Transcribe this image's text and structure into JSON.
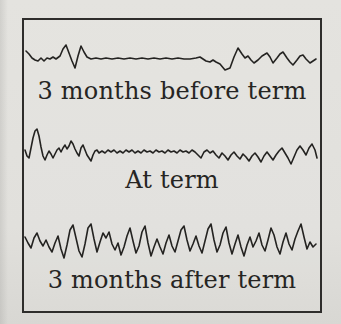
{
  "figure": {
    "background_color": "#e1e0dc",
    "frame_color": "#2e2d2b",
    "trace_color": "#242321",
    "text_color": "#262523",
    "panels": [
      {
        "label": "3 months before term"
      },
      {
        "label": "At term"
      },
      {
        "label": "3 months after term"
      }
    ],
    "traces": [
      {
        "name": "trace-3-months-before-term",
        "points": [
          [
            26,
            51
          ],
          [
            29,
            54
          ],
          [
            32,
            58
          ],
          [
            35,
            60
          ],
          [
            38,
            61
          ],
          [
            41,
            58
          ],
          [
            44,
            61
          ],
          [
            47,
            58
          ],
          [
            50,
            59
          ],
          [
            53,
            57
          ],
          [
            56,
            59
          ],
          [
            60,
            56
          ],
          [
            63,
            49
          ],
          [
            66,
            45
          ],
          [
            69,
            53
          ],
          [
            72,
            61
          ],
          [
            75,
            68
          ],
          [
            78,
            56
          ],
          [
            81,
            46
          ],
          [
            84,
            52
          ],
          [
            87,
            57
          ],
          [
            91,
            59
          ],
          [
            96,
            58
          ],
          [
            101,
            59
          ],
          [
            106,
            58
          ],
          [
            112,
            59
          ],
          [
            118,
            58
          ],
          [
            124,
            59
          ],
          [
            130,
            58
          ],
          [
            136,
            59
          ],
          [
            142,
            58
          ],
          [
            148,
            59
          ],
          [
            154,
            58
          ],
          [
            160,
            59
          ],
          [
            166,
            58
          ],
          [
            172,
            59
          ],
          [
            178,
            58
          ],
          [
            184,
            59
          ],
          [
            190,
            59
          ],
          [
            196,
            58
          ],
          [
            200,
            57
          ],
          [
            203,
            59
          ],
          [
            206,
            61
          ],
          [
            210,
            62
          ],
          [
            213,
            60
          ],
          [
            216,
            62
          ],
          [
            220,
            64
          ],
          [
            225,
            70
          ],
          [
            230,
            68
          ],
          [
            234,
            57
          ],
          [
            238,
            48
          ],
          [
            242,
            54
          ],
          [
            245,
            58
          ],
          [
            248,
            56
          ],
          [
            251,
            60
          ],
          [
            254,
            63
          ],
          [
            258,
            60
          ],
          [
            262,
            56
          ],
          [
            267,
            53
          ],
          [
            270,
            57
          ],
          [
            273,
            63
          ],
          [
            277,
            58
          ],
          [
            280,
            54
          ],
          [
            283,
            52
          ],
          [
            287,
            58
          ],
          [
            290,
            62
          ],
          [
            293,
            65
          ],
          [
            297,
            60
          ],
          [
            300,
            56
          ],
          [
            303,
            55
          ],
          [
            306,
            59
          ],
          [
            310,
            63
          ],
          [
            313,
            61
          ],
          [
            316,
            59
          ]
        ]
      },
      {
        "name": "trace-at-term",
        "points": [
          [
            25,
            150
          ],
          [
            27,
            156
          ],
          [
            29,
            158
          ],
          [
            31,
            148
          ],
          [
            33,
            138
          ],
          [
            35,
            131
          ],
          [
            37,
            129
          ],
          [
            39,
            136
          ],
          [
            41,
            147
          ],
          [
            43,
            156
          ],
          [
            45,
            160
          ],
          [
            47,
            155
          ],
          [
            49,
            151
          ],
          [
            51,
            154
          ],
          [
            53,
            158
          ],
          [
            55,
            154
          ],
          [
            57,
            150
          ],
          [
            59,
            148
          ],
          [
            61,
            152
          ],
          [
            63,
            148
          ],
          [
            65,
            145
          ],
          [
            67,
            149
          ],
          [
            69,
            146
          ],
          [
            71,
            141
          ],
          [
            73,
            144
          ],
          [
            75,
            149
          ],
          [
            77,
            153
          ],
          [
            79,
            156
          ],
          [
            81,
            148
          ],
          [
            83,
            145
          ],
          [
            85,
            150
          ],
          [
            87,
            155
          ],
          [
            89,
            158
          ],
          [
            91,
            161
          ],
          [
            93,
            155
          ],
          [
            95,
            151
          ],
          [
            97,
            150
          ],
          [
            99,
            153
          ],
          [
            102,
            151
          ],
          [
            105,
            153
          ],
          [
            108,
            150
          ],
          [
            111,
            152
          ],
          [
            114,
            150
          ],
          [
            117,
            153
          ],
          [
            120,
            151
          ],
          [
            123,
            153
          ],
          [
            126,
            150
          ],
          [
            129,
            152
          ],
          [
            132,
            150
          ],
          [
            135,
            153
          ],
          [
            138,
            151
          ],
          [
            141,
            153
          ],
          [
            144,
            150
          ],
          [
            147,
            152
          ],
          [
            150,
            151
          ],
          [
            153,
            153
          ],
          [
            156,
            150
          ],
          [
            159,
            152
          ],
          [
            162,
            151
          ],
          [
            165,
            153
          ],
          [
            168,
            150
          ],
          [
            171,
            152
          ],
          [
            174,
            151
          ],
          [
            177,
            153
          ],
          [
            180,
            150
          ],
          [
            183,
            152
          ],
          [
            186,
            151
          ],
          [
            189,
            153
          ],
          [
            192,
            150
          ],
          [
            195,
            152
          ],
          [
            198,
            155
          ],
          [
            201,
            158
          ],
          [
            204,
            152
          ],
          [
            207,
            150
          ],
          [
            210,
            153
          ],
          [
            213,
            151
          ],
          [
            216,
            155
          ],
          [
            219,
            158
          ],
          [
            222,
            153
          ],
          [
            225,
            156
          ],
          [
            228,
            160
          ],
          [
            231,
            155
          ],
          [
            234,
            152
          ],
          [
            237,
            156
          ],
          [
            240,
            159
          ],
          [
            243,
            154
          ],
          [
            246,
            157
          ],
          [
            249,
            161
          ],
          [
            252,
            156
          ],
          [
            255,
            153
          ],
          [
            258,
            157
          ],
          [
            261,
            162
          ],
          [
            264,
            156
          ],
          [
            267,
            152
          ],
          [
            270,
            156
          ],
          [
            273,
            160
          ],
          [
            276,
            155
          ],
          [
            279,
            151
          ],
          [
            282,
            148
          ],
          [
            285,
            153
          ],
          [
            288,
            158
          ],
          [
            291,
            164
          ],
          [
            294,
            157
          ],
          [
            297,
            150
          ],
          [
            300,
            146
          ],
          [
            303,
            150
          ],
          [
            306,
            155
          ],
          [
            309,
            148
          ],
          [
            312,
            144
          ],
          [
            315,
            150
          ],
          [
            317,
            158
          ]
        ]
      },
      {
        "name": "trace-3-months-after-term",
        "points": [
          [
            25,
            237
          ],
          [
            28,
            243
          ],
          [
            31,
            248
          ],
          [
            34,
            238
          ],
          [
            37,
            233
          ],
          [
            40,
            241
          ],
          [
            43,
            246
          ],
          [
            46,
            240
          ],
          [
            49,
            247
          ],
          [
            52,
            252
          ],
          [
            55,
            243
          ],
          [
            58,
            236
          ],
          [
            61,
            249
          ],
          [
            64,
            258
          ],
          [
            67,
            245
          ],
          [
            70,
            230
          ],
          [
            73,
            225
          ],
          [
            76,
            238
          ],
          [
            79,
            251
          ],
          [
            82,
            257
          ],
          [
            85,
            244
          ],
          [
            88,
            228
          ],
          [
            91,
            224
          ],
          [
            94,
            239
          ],
          [
            97,
            252
          ],
          [
            100,
            242
          ],
          [
            103,
            233
          ],
          [
            106,
            238
          ],
          [
            109,
            232
          ],
          [
            112,
            244
          ],
          [
            115,
            250
          ],
          [
            118,
            243
          ],
          [
            121,
            255
          ],
          [
            124,
            247
          ],
          [
            127,
            236
          ],
          [
            130,
            228
          ],
          [
            133,
            241
          ],
          [
            136,
            253
          ],
          [
            139,
            246
          ],
          [
            142,
            232
          ],
          [
            145,
            226
          ],
          [
            148,
            243
          ],
          [
            151,
            256
          ],
          [
            154,
            247
          ],
          [
            157,
            239
          ],
          [
            160,
            247
          ],
          [
            163,
            254
          ],
          [
            166,
            243
          ],
          [
            169,
            235
          ],
          [
            172,
            246
          ],
          [
            175,
            252
          ],
          [
            178,
            241
          ],
          [
            181,
            230
          ],
          [
            184,
            226
          ],
          [
            187,
            240
          ],
          [
            190,
            251
          ],
          [
            193,
            244
          ],
          [
            196,
            236
          ],
          [
            199,
            246
          ],
          [
            202,
            253
          ],
          [
            205,
            241
          ],
          [
            208,
            229
          ],
          [
            211,
            224
          ],
          [
            214,
            240
          ],
          [
            217,
            252
          ],
          [
            220,
            245
          ],
          [
            223,
            233
          ],
          [
            226,
            227
          ],
          [
            229,
            243
          ],
          [
            232,
            254
          ],
          [
            235,
            244
          ],
          [
            238,
            235
          ],
          [
            241,
            247
          ],
          [
            244,
            256
          ],
          [
            247,
            245
          ],
          [
            250,
            237
          ],
          [
            253,
            247
          ],
          [
            256,
            241
          ],
          [
            259,
            233
          ],
          [
            262,
            245
          ],
          [
            265,
            251
          ],
          [
            268,
            240
          ],
          [
            271,
            228
          ],
          [
            274,
            235
          ],
          [
            277,
            247
          ],
          [
            280,
            254
          ],
          [
            283,
            242
          ],
          [
            286,
            233
          ],
          [
            289,
            244
          ],
          [
            292,
            250
          ],
          [
            295,
            239
          ],
          [
            298,
            231
          ],
          [
            301,
            224
          ],
          [
            304,
            237
          ],
          [
            307,
            249
          ],
          [
            310,
            242
          ],
          [
            313,
            247
          ],
          [
            316,
            244
          ]
        ]
      }
    ]
  }
}
